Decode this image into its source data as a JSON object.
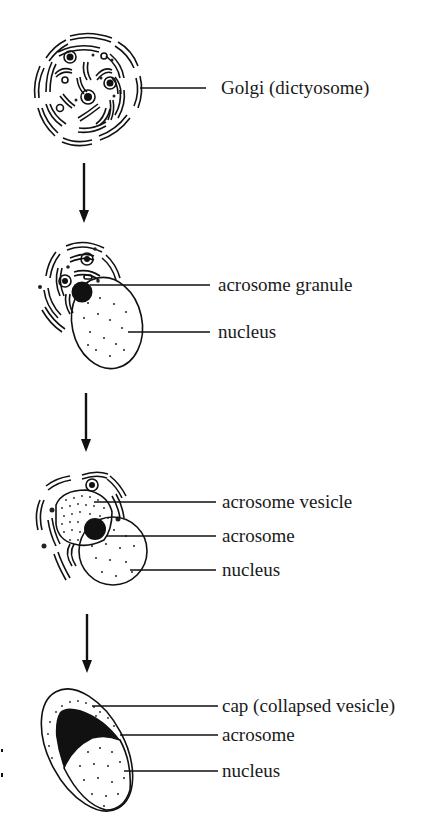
{
  "figure": {
    "stages": [
      {
        "id": "stage-1",
        "labels": [
          "Golgi (dictyosome)"
        ]
      },
      {
        "id": "stage-2",
        "labels": [
          "acrosome granule",
          "nucleus"
        ]
      },
      {
        "id": "stage-3",
        "labels": [
          "acrosome vesicle",
          "acrosome",
          "nucleus"
        ]
      },
      {
        "id": "stage-4",
        "labels": [
          "cap (collapsed vesicle)",
          "acrosome",
          "nucleus"
        ]
      }
    ],
    "arrows": 3
  },
  "colors": {
    "ink": "#111111",
    "background": "#ffffff"
  }
}
